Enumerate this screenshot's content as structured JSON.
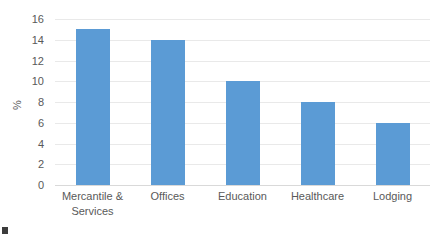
{
  "chart_data": {
    "type": "bar",
    "title": "",
    "xlabel": "",
    "ylabel": "%",
    "categories": [
      "Mercantile &\nServices",
      "Offices",
      "Education",
      "Healthcare",
      "Lodging"
    ],
    "values": [
      15,
      14,
      10,
      8,
      6
    ],
    "ylim": [
      0,
      16
    ],
    "yticks": [
      0,
      2,
      4,
      6,
      8,
      10,
      12,
      14,
      16
    ],
    "ytick_labels": [
      "0",
      "2",
      "4",
      "6",
      "8",
      "10",
      "12",
      "14",
      "16"
    ],
    "grid": true,
    "legend": false,
    "series": [
      {
        "name": "",
        "values": [
          15,
          14,
          10,
          8,
          6
        ],
        "color": "#5B9BD5"
      }
    ]
  },
  "style": {
    "bar_color": "#5B9BD5",
    "gridline_color": "#E9E9E9",
    "baseline_color": "#D9D9D9",
    "text_color": "#595959",
    "background": "#FFFFFF"
  }
}
